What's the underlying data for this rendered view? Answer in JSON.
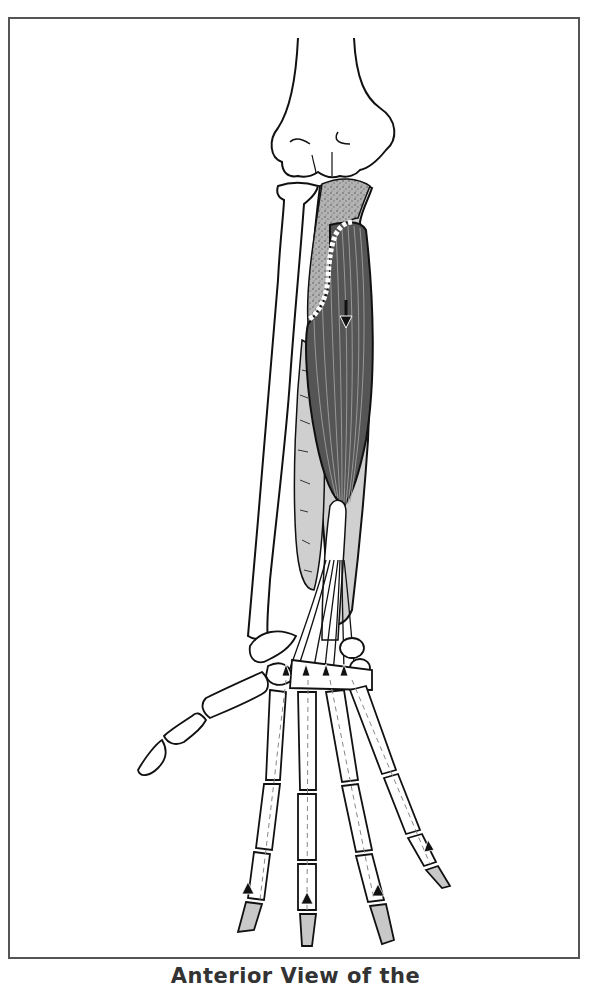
{
  "figure": {
    "caption": "Anterior View of the",
    "view": "anterior",
    "arrows": {
      "muscle_direction": "down",
      "tendon_direction": "up",
      "count": 9
    }
  },
  "colors": {
    "frame": "#555555",
    "outline": "#111111",
    "bone_fill": "#ffffff",
    "muscle_dark": "#4a4a4a",
    "muscle_light": "#cfcfcf",
    "origin_stipple": "#a9a9a9",
    "tendon": "#ffffff",
    "caption_text": "#333333"
  }
}
